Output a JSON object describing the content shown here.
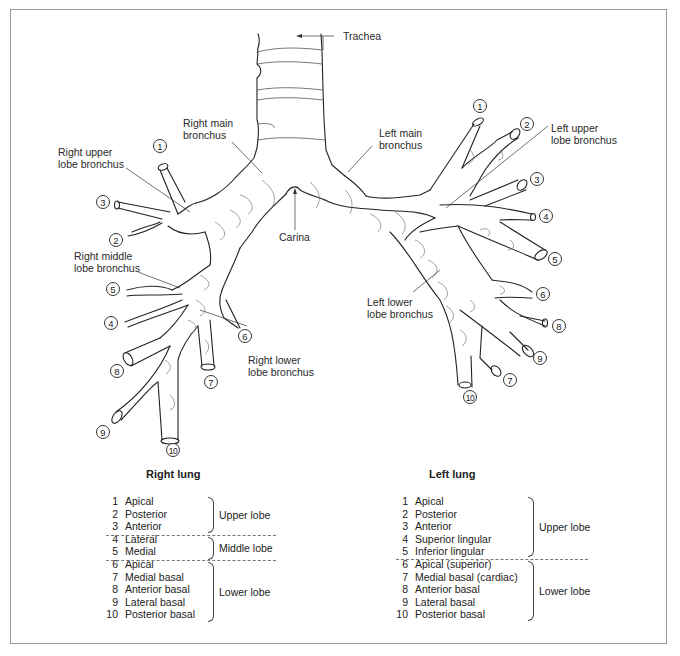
{
  "figure": {
    "labels": {
      "trachea": "Trachea",
      "right_main_bronchus": "Right main\nbronchus",
      "left_main_bronchus": "Left main\nbronchus",
      "right_upper_lobe_bronchus": "Right upper\nlobe bronchus",
      "left_upper_lobe_bronchus": "Left upper\nlobe bronchus",
      "carina": "Carina",
      "right_middle_lobe_bronchus": "Right middle\nlobe bronchus",
      "right_lower_lobe_bronchus": "Right lower\nlobe bronchus",
      "left_lower_lobe_bronchus": "Left lower\nlobe bronchus"
    },
    "right_segment_markers": [
      "1",
      "2",
      "3",
      "4",
      "5",
      "6",
      "7",
      "8",
      "9",
      "10"
    ],
    "left_segment_markers": [
      "1",
      "2",
      "3",
      "4",
      "5",
      "6",
      "7",
      "8",
      "9",
      "10"
    ],
    "colors": {
      "line": "#222222",
      "texture": "#666666",
      "frame": "#9a9a9a"
    }
  },
  "right_lung": {
    "title": "Right lung",
    "groups": [
      {
        "lobe": "Upper lobe",
        "segments": [
          {
            "n": "1",
            "name": "Apical"
          },
          {
            "n": "2",
            "name": "Posterior"
          },
          {
            "n": "3",
            "name": "Anterior"
          }
        ]
      },
      {
        "lobe": "Middle lobe",
        "segments": [
          {
            "n": "4",
            "name": "Lateral"
          },
          {
            "n": "5",
            "name": "Medial"
          }
        ]
      },
      {
        "lobe": "Lower lobe",
        "segments": [
          {
            "n": "6",
            "name": "Apical"
          },
          {
            "n": "7",
            "name": "Medial basal"
          },
          {
            "n": "8",
            "name": "Anterior basal"
          },
          {
            "n": "9",
            "name": "Lateral basal"
          },
          {
            "n": "10",
            "name": "Posterior basal"
          }
        ]
      }
    ]
  },
  "left_lung": {
    "title": "Left lung",
    "groups": [
      {
        "lobe": "Upper lobe",
        "segments": [
          {
            "n": "1",
            "name": "Apical"
          },
          {
            "n": "2",
            "name": "Posterior"
          },
          {
            "n": "3",
            "name": "Anterior"
          },
          {
            "n": "4",
            "name": "Superior lingular"
          },
          {
            "n": "5",
            "name": "Inferior lingular"
          }
        ]
      },
      {
        "lobe": "Lower lobe",
        "segments": [
          {
            "n": "6",
            "name": "Apical (superior)"
          },
          {
            "n": "7",
            "name": "Medial basal (cardiac)"
          },
          {
            "n": "8",
            "name": "Anterior basal"
          },
          {
            "n": "9",
            "name": "Lateral basal"
          },
          {
            "n": "10",
            "name": "Posterior basal"
          }
        ]
      }
    ]
  }
}
